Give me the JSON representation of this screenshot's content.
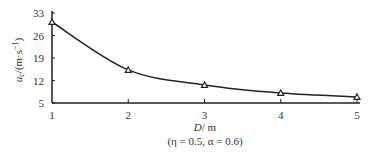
{
  "chart_data": {
    "type": "line",
    "title": "",
    "xlabel": "D/ m",
    "ylabel": "u_c/(m·s⁻¹)",
    "subtitle": "(η = 0.5,  α = 0.6)",
    "x": [
      1,
      2,
      3,
      4,
      5
    ],
    "series": [
      {
        "name": "u_c",
        "values": [
          30.2,
          15.3,
          10.6,
          8.1,
          6.9
        ],
        "marker": "triangle",
        "color": "#222222"
      }
    ],
    "xlim": [
      1,
      5
    ],
    "ylim": [
      5,
      33
    ],
    "xticks": [
      "1",
      "2",
      "3",
      "4",
      "5"
    ],
    "yticks": [
      "5",
      "12",
      "19",
      "26",
      "33"
    ],
    "grid": false,
    "legend": "none"
  },
  "labels": {
    "xlabel_italic": "D",
    "xlabel_unit": "/ m",
    "ylabel_var": "u",
    "ylabel_sub": "c",
    "ylabel_unit": "/(m·s",
    "ylabel_exp": "−1",
    "ylabel_close": ")",
    "params": "(η = 0.5,  α = 0.6)"
  }
}
